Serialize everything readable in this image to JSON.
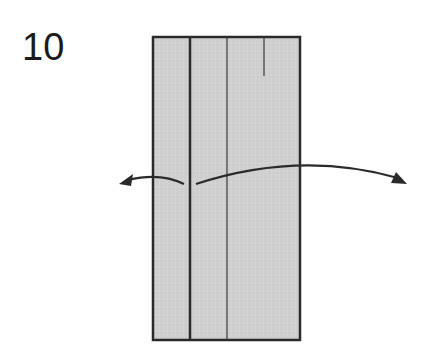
{
  "diagram": {
    "step_number": "10",
    "colors": {
      "paper_fill": "#cfcfcf",
      "line": "#2a2a2a",
      "background": "#ffffff"
    },
    "paper": {
      "x": 153,
      "y": 37,
      "width": 147,
      "height": 303
    },
    "creases": [
      {
        "type": "edge-thick",
        "x": 190,
        "y1": 37,
        "y2": 340
      },
      {
        "type": "crease-thin",
        "x": 227,
        "y1": 37,
        "y2": 340
      },
      {
        "type": "short-crease",
        "x": 264,
        "y1": 37,
        "y2": 76
      }
    ],
    "arrows": [
      {
        "name": "unfold-left-arrow",
        "direction": "left"
      },
      {
        "name": "unfold-right-arrow",
        "direction": "right"
      }
    ]
  }
}
